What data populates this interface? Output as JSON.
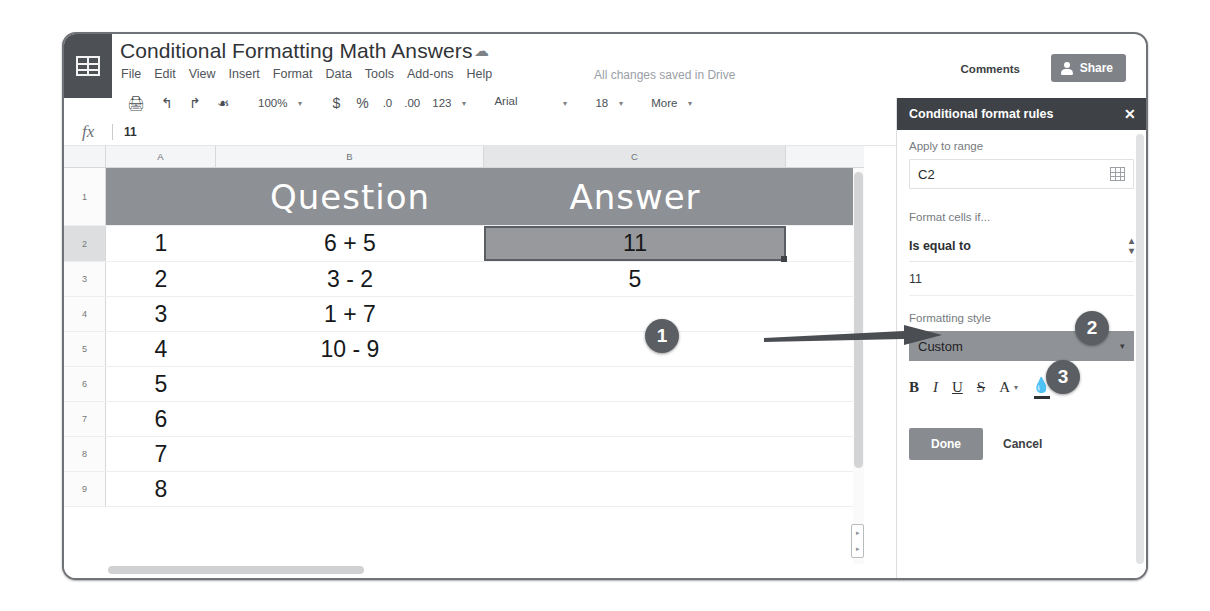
{
  "app": {
    "logo_icon": "sheets-grid-icon",
    "doc_title": "Conditional Formatting Math Answers",
    "cloud_icon": "drive-cloud-icon",
    "save_status": "All changes saved in Drive"
  },
  "menubar": {
    "items": [
      "File",
      "Edit",
      "View",
      "Insert",
      "Format",
      "Data",
      "Tools",
      "Add-ons",
      "Help"
    ]
  },
  "header_actions": {
    "comments_label": "Comments",
    "share_label": "Share",
    "share_icon": "person-add-icon"
  },
  "toolbar": {
    "print_icon": "print-icon",
    "undo_icon": "undo-arrow-icon",
    "redo_icon": "redo-arrow-icon",
    "paint_icon": "paint-format-icon",
    "zoom_value": "100%",
    "currency_label": "$",
    "percent_label": "%",
    "decrease_decimal_label": ".0",
    "increase_decimal_label": ".00",
    "number_format_label": "123",
    "font_name": "Arial",
    "font_size": "18",
    "more_label": "More"
  },
  "formula_bar": {
    "fx_label": "fx",
    "value": "11"
  },
  "grid": {
    "columns": [
      "A",
      "B",
      "C"
    ],
    "selected_column": "C",
    "selected_row": "2",
    "header_row": {
      "row_label": "1",
      "a": "",
      "b": "Question",
      "c": "Answer"
    },
    "rows": [
      {
        "row_label": "2",
        "a": "1",
        "b": "6 + 5",
        "c": "11",
        "selected": true
      },
      {
        "row_label": "3",
        "a": "2",
        "b": "3 - 2",
        "c": "5",
        "selected": false
      },
      {
        "row_label": "4",
        "a": "3",
        "b": "1 + 7",
        "c": "",
        "selected": false
      },
      {
        "row_label": "5",
        "a": "4",
        "b": "10 - 9",
        "c": "",
        "selected": false
      },
      {
        "row_label": "6",
        "a": "5",
        "b": "",
        "c": "",
        "selected": false
      },
      {
        "row_label": "7",
        "a": "6",
        "b": "",
        "c": "",
        "selected": false
      },
      {
        "row_label": "8",
        "a": "7",
        "b": "",
        "c": "",
        "selected": false
      },
      {
        "row_label": "9",
        "a": "8",
        "b": "",
        "c": "",
        "selected": false
      }
    ]
  },
  "panel": {
    "title": "Conditional format rules",
    "close_icon": "close-icon",
    "apply_to_range_label": "Apply to range",
    "apply_to_range_value": "C2",
    "range_picker_icon": "grid-select-icon",
    "format_cells_if_label": "Format cells if...",
    "condition_value": "Is equal to",
    "condition_caret_icon": "updown-chevron-icon",
    "criteria_value": "11",
    "formatting_style_label": "Formatting style",
    "formatting_style_value": "Custom",
    "style_caret_icon": "chevron-down-icon",
    "format_buttons": {
      "bold": "B",
      "italic": "I",
      "underline": "U",
      "strikethrough": "S",
      "text_color": "A",
      "text_color_caret_icon": "chevron-down-icon",
      "fill_color_icon": "fill-color-icon",
      "fill_color_caret_icon": "chevron-down-icon"
    },
    "done_label": "Done",
    "cancel_label": "Cancel"
  },
  "callouts": [
    {
      "number": "1"
    },
    {
      "number": "2"
    },
    {
      "number": "3"
    },
    {
      "number": "4"
    }
  ],
  "colors": {
    "panel_header": "#3e4145",
    "header_band": "#8d9095",
    "selected_cell": "#97999c",
    "share_button": "#7f8388",
    "badge": "#5b5e62",
    "done_button": "#888c90"
  }
}
